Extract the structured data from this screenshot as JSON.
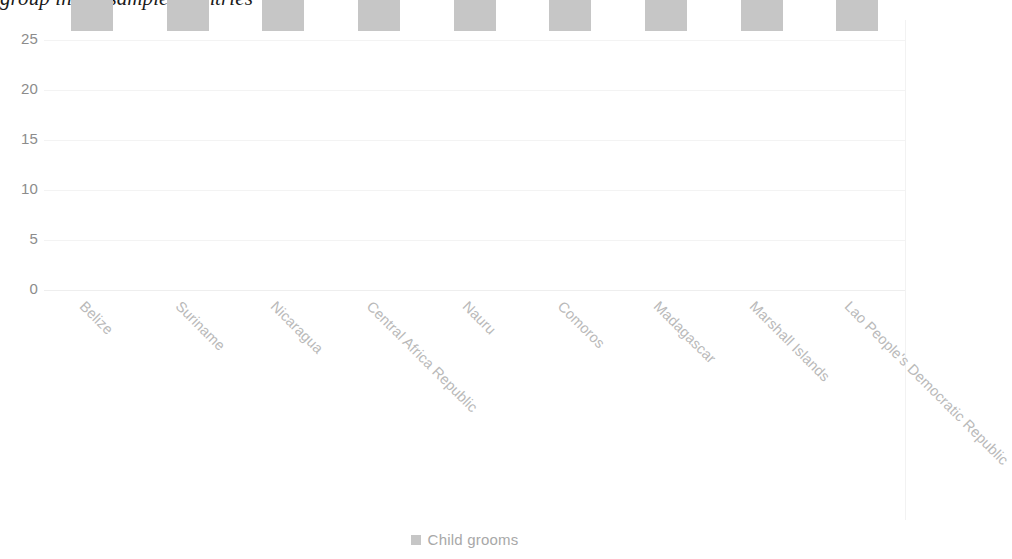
{
  "chart_data": {
    "type": "bar",
    "title": "group in the sample countries",
    "xlabel": "",
    "ylabel": "",
    "ylim": [
      0,
      25
    ],
    "yticks": [
      0,
      5,
      10,
      15,
      20,
      25
    ],
    "grid": true,
    "legend_position": "bottom",
    "bar_color": "#c6c6c6",
    "categories": [
      "Belize",
      "Suriname",
      "Nicaragua",
      "Central Africa Republic",
      "Nauru",
      "Comoros",
      "Madagascar",
      "Marshall Islands",
      "Lao People's Democratic Republic"
    ],
    "series": [
      {
        "name": "Child grooms",
        "values": [
          22,
          20,
          19,
          17,
          12,
          12,
          12,
          12,
          11
        ]
      }
    ]
  },
  "axis": {
    "y_tick_labels": [
      "25",
      "20",
      "15",
      "10",
      "5",
      "0"
    ]
  },
  "legend": {
    "entries": [
      {
        "label": "Child grooms",
        "color": "#c6c6c6"
      }
    ]
  }
}
